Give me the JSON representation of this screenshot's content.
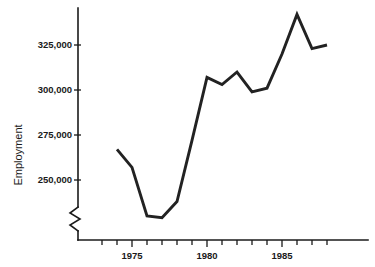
{
  "chart_data": {
    "type": "line",
    "title": "",
    "xlabel": "",
    "ylabel": "Employment",
    "x": [
      1974,
      1975,
      1976,
      1977,
      1978,
      1979,
      1980,
      1981,
      1982,
      1983,
      1984,
      1985,
      1986,
      1987,
      1988
    ],
    "values": [
      267000,
      257000,
      230000,
      229000,
      238000,
      272000,
      307000,
      303000,
      310000,
      299000,
      301000,
      320000,
      342000,
      323000,
      325000
    ],
    "series": [
      {
        "name": "Employment",
        "values": [
          267000,
          257000,
          230000,
          229000,
          238000,
          272000,
          307000,
          303000,
          310000,
          299000,
          301000,
          320000,
          342000,
          323000,
          325000
        ]
      }
    ],
    "y_ticks": [
      250000,
      275000,
      300000,
      325000
    ],
    "y_tick_labels": [
      "250,000",
      "275,000",
      "300,000",
      "325,000"
    ],
    "x_ticks": [
      1974,
      1975,
      1976,
      1977,
      1978,
      1979,
      1980,
      1981,
      1982,
      1983,
      1984,
      1985,
      1986,
      1987,
      1988
    ],
    "x_tick_labels": [
      "",
      "1975",
      "",
      "",
      "",
      "",
      "1980",
      "",
      "",
      "",
      "",
      "1985",
      "",
      "",
      ""
    ],
    "xlim": [
      1973.2,
      1988.8
    ],
    "ylim": [
      222000,
      346000
    ],
    "grid": false,
    "legend": false,
    "axis_break": true,
    "axis_break_axis": "y",
    "line_color": "#222222"
  },
  "axes": {
    "y_label": "Employment",
    "y_tick_250": "250,000",
    "y_tick_275": "275,000",
    "y_tick_300": "300,000",
    "y_tick_325": "325,000",
    "x_tick_1975": "1975",
    "x_tick_1980": "1980",
    "x_tick_1985": "1985"
  }
}
